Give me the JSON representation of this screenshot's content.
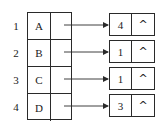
{
  "diagram": {
    "type": "adjacency-list",
    "head_rows": [
      {
        "index": "1",
        "vertex": "A"
      },
      {
        "index": "2",
        "vertex": "B"
      },
      {
        "index": "3",
        "vertex": "C"
      },
      {
        "index": "4",
        "vertex": "D"
      }
    ],
    "nodes": [
      {
        "value": "4",
        "next": "^"
      },
      {
        "value": "1",
        "next": "^"
      },
      {
        "value": "1",
        "next": "^"
      },
      {
        "value": "3",
        "next": "^"
      }
    ],
    "colors": {
      "line": "#2a2a2a",
      "text": "#1a1a1a",
      "background": "#ffffff"
    }
  }
}
